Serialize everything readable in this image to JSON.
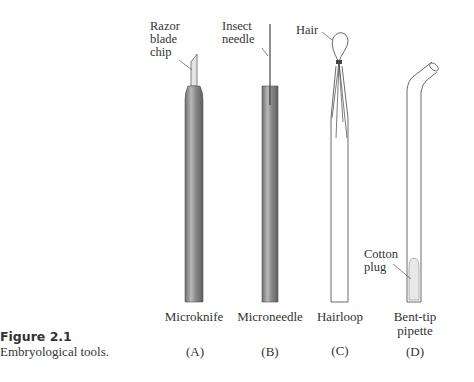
{
  "figure": {
    "number": "Figure 2.1",
    "caption": "Embryological tools."
  },
  "tools": [
    {
      "name": "Microknife",
      "letter": "(A)",
      "annotation": [
        "Razor",
        "blade",
        "chip"
      ]
    },
    {
      "name": "Microneedle",
      "letter": "(B)",
      "annotation": [
        "Insect",
        "needle"
      ]
    },
    {
      "name": "Hairloop",
      "letter": "(C)",
      "annotation": [
        "Hair"
      ]
    },
    {
      "name_lines": [
        "Bent-tip",
        "pipette"
      ],
      "letter": "(D)",
      "annotation": [
        "Cotton",
        "plug"
      ]
    }
  ]
}
